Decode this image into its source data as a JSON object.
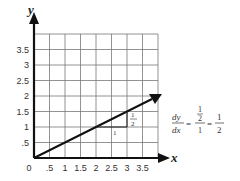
{
  "chart_data": {
    "type": "line",
    "title": "",
    "xlabel": "x",
    "ylabel": "y",
    "xlim": [
      0,
      4
    ],
    "ylim": [
      0,
      4
    ],
    "grid": true,
    "x_ticks": [
      "0",
      ".5",
      "1",
      "1.5",
      "2",
      "2.5",
      "3",
      "3.5"
    ],
    "y_ticks": [
      ".5",
      "1",
      "1.5",
      "2",
      "2.5",
      "3",
      "3.5"
    ],
    "series": [
      {
        "name": "y = x/2",
        "x": [
          0,
          4
        ],
        "y": [
          0,
          2
        ]
      }
    ],
    "annotations": {
      "run_label": "1",
      "rise_label_num": "1",
      "rise_label_den": "2",
      "slope_triangle": {
        "from": [
          2,
          1
        ],
        "to": [
          3,
          1.5
        ]
      }
    }
  },
  "formula": {
    "lhs_num": "dy",
    "lhs_den": "dx",
    "eq": "=",
    "mid_num_num": "1",
    "mid_num_den": "2",
    "mid_den": "1",
    "rhs_num": "1",
    "rhs_den": "2"
  }
}
